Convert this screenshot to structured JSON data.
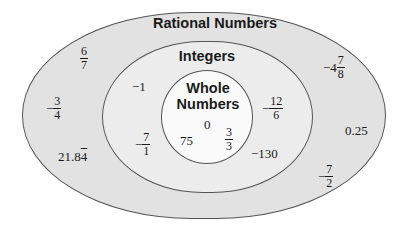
{
  "diagram": {
    "type": "nested-venn",
    "colors": {
      "outer_fill": "#e2e2e2",
      "middle_fill": "#ececec",
      "inner_fill": "#fafafa",
      "stroke": "#555555"
    },
    "sets": {
      "rational": {
        "label": "Rational Numbers",
        "members": [
          {
            "sign": "",
            "num": "6",
            "den": "7"
          },
          {
            "sign": "−",
            "num": "3",
            "den": "4"
          },
          {
            "text_main": "21.8",
            "text_repeat": "4"
          },
          {
            "sign": "−4",
            "num": "7",
            "den": "8"
          },
          {
            "text": "0.25"
          },
          {
            "sign": "−",
            "num": "7",
            "den": "2"
          }
        ]
      },
      "integers": {
        "label": "Integers",
        "members": [
          {
            "text": "−1"
          },
          {
            "sign": "−",
            "num": "7",
            "den": "1"
          },
          {
            "sign": "−",
            "num": "12",
            "den": "6"
          },
          {
            "text": "−130"
          }
        ]
      },
      "whole": {
        "label_line1": "Whole",
        "label_line2": "Numbers",
        "members": [
          {
            "text": "0"
          },
          {
            "text": "75"
          },
          {
            "sign": "",
            "num": "3",
            "den": "3"
          }
        ]
      }
    }
  }
}
